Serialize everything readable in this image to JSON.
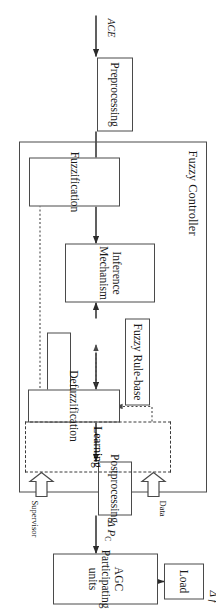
{
  "figure": {
    "type": "block-diagram",
    "orientation_note": "printed rotated 90 degrees"
  },
  "blocks": {
    "preprocessing": {
      "label": "Preprocessing"
    },
    "fuzzification": {
      "label": "Fuzzification"
    },
    "inference": {
      "line1": "Inference",
      "line2": "Mechanism"
    },
    "rulebase": {
      "label": "Fuzzy Rule-base"
    },
    "defuzzification": {
      "label": "Defuzzification"
    },
    "postprocessing": {
      "label": "Postprocessing"
    },
    "agc": {
      "line1": "AGC",
      "line2": "Participating units"
    },
    "load": {
      "label": "Load"
    },
    "learning": {
      "label": "Learning"
    }
  },
  "containers": {
    "fuzzy_controller": {
      "label": "Fuzzy Controller"
    }
  },
  "signals": {
    "ace": {
      "label": "ACE"
    },
    "delta_pc": {
      "label": "Δ P",
      "sub": "C"
    },
    "delta_f": {
      "label": "Δ f"
    }
  },
  "annotations": {
    "data": {
      "label": "Data"
    },
    "supervisor": {
      "label": "Supervisor"
    }
  },
  "colors": {
    "stroke": "#4a4a4a",
    "text": "#1a1a1a",
    "background": "#ffffff",
    "dashed": "#3a3a3a"
  }
}
